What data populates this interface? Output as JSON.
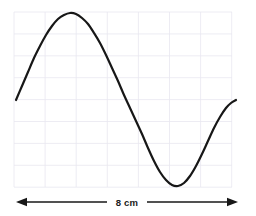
{
  "figure": {
    "kind": "wavelength-diagram",
    "background_color": "#ffffff",
    "grid": {
      "visible": true,
      "color": "#e9e7f0",
      "line_width": 0.8,
      "left": 14,
      "top": 12,
      "right": 232,
      "bottom": 187,
      "columns": 7,
      "rows": 8,
      "cell_width": 31.1,
      "cell_height": 21.9
    },
    "curve": {
      "color": "#171717",
      "line_width": 2.2,
      "shape": "sine",
      "cycles": 1,
      "start_point": {
        "x": 16,
        "y": 100
      },
      "crest_point": {
        "x": 70,
        "y": 13
      },
      "midline_y": 99,
      "trough_point": {
        "x": 172,
        "y": 185
      },
      "end_point": {
        "x": 236,
        "y": 100
      },
      "amplitude_px": 86,
      "wavelength_px": 220
    },
    "dimension": {
      "label": "8 cm",
      "value": 8,
      "unit": "cm",
      "quantity": "wavelength",
      "color": "#171717",
      "line_y": 202,
      "left_x": 16,
      "right_x": 238,
      "line_width": 1.3,
      "arrow_head_length": 11,
      "arrow_head_half_width": 4.2,
      "label_center_x": 127,
      "label_center_y": 202,
      "left_arrow": "arrow-left-icon",
      "right_arrow": "arrow-right-icon"
    }
  },
  "chart_data": {
    "type": "line",
    "title": "",
    "subtitle": "",
    "xlabel": "",
    "ylabel": "",
    "grid": true,
    "legend": null,
    "annotations": [
      {
        "text": "8 cm",
        "role": "dimension-label",
        "describes": "one full wavelength",
        "x_px": 127,
        "y_px": 202
      }
    ],
    "series": [
      {
        "name": "wave",
        "form": "sine",
        "amplitude_cm": 0,
        "wavelength_cm": 8,
        "phase": 0,
        "points_px": [
          {
            "x": 16,
            "y": 100
          },
          {
            "x": 22,
            "y": 86
          },
          {
            "x": 28,
            "y": 72
          },
          {
            "x": 34,
            "y": 58
          },
          {
            "x": 40,
            "y": 46
          },
          {
            "x": 46,
            "y": 35
          },
          {
            "x": 52,
            "y": 26
          },
          {
            "x": 58,
            "y": 19
          },
          {
            "x": 64,
            "y": 15
          },
          {
            "x": 70,
            "y": 13
          },
          {
            "x": 76,
            "y": 14
          },
          {
            "x": 82,
            "y": 18
          },
          {
            "x": 88,
            "y": 24
          },
          {
            "x": 94,
            "y": 33
          },
          {
            "x": 100,
            "y": 43
          },
          {
            "x": 106,
            "y": 55
          },
          {
            "x": 112,
            "y": 68
          },
          {
            "x": 118,
            "y": 81
          },
          {
            "x": 124,
            "y": 95
          },
          {
            "x": 130,
            "y": 108
          },
          {
            "x": 136,
            "y": 121
          },
          {
            "x": 142,
            "y": 134
          },
          {
            "x": 148,
            "y": 148
          },
          {
            "x": 154,
            "y": 161
          },
          {
            "x": 160,
            "y": 172
          },
          {
            "x": 166,
            "y": 180
          },
          {
            "x": 172,
            "y": 185
          },
          {
            "x": 178,
            "y": 186
          },
          {
            "x": 184,
            "y": 183
          },
          {
            "x": 190,
            "y": 176
          },
          {
            "x": 196,
            "y": 166
          },
          {
            "x": 202,
            "y": 154
          },
          {
            "x": 208,
            "y": 141
          },
          {
            "x": 214,
            "y": 128
          },
          {
            "x": 220,
            "y": 117
          },
          {
            "x": 226,
            "y": 108
          },
          {
            "x": 231,
            "y": 103
          },
          {
            "x": 236,
            "y": 100
          }
        ]
      }
    ]
  }
}
